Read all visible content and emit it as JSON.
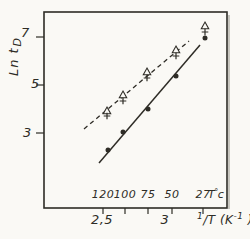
{
  "figure": {
    "bg": "#faf9f5",
    "ink": "#2e2c26",
    "shadow": "#bcbab2"
  },
  "axes": {
    "y_label_main": "Ln t",
    "y_label_sub": "D",
    "y_ticks": [
      {
        "label": "7",
        "value": 7,
        "y": 37,
        "lx": 21,
        "ly": 26
      },
      {
        "label": "5",
        "value": 5,
        "y": 85,
        "lx": 31,
        "ly": 77
      },
      {
        "label": "3",
        "value": 3,
        "y": 133,
        "lx": 23,
        "ly": 126
      }
    ],
    "x_top_ticks": [
      {
        "label": "120",
        "value": 120,
        "x": 103
      },
      {
        "label": "100",
        "value": 100,
        "x": 125
      },
      {
        "label": "75",
        "value": 75,
        "x": 148
      },
      {
        "label": "50",
        "value": 50,
        "x": 172
      },
      {
        "label": "27",
        "value": 27,
        "x": 203
      }
    ],
    "x_top_unit": {
      "T": "T",
      "ring": "°",
      "c": "c"
    },
    "x_bottom_labels": [
      {
        "label": "2,5",
        "value": 2.5,
        "x": 102
      },
      {
        "label": "3",
        "value": 3,
        "x": 165
      }
    ],
    "x_unit": {
      "num": "1",
      "mid": "/T (K",
      "sup": "-1",
      "end": " )"
    }
  },
  "chart_data": {
    "type": "scatter",
    "title": "",
    "ylabel": "Ln t_D",
    "xlabel": "1/T (K-1)",
    "xlabel_secondary": "T (°C)",
    "grid": false,
    "legend": "none",
    "y_ticks": [
      3,
      5,
      7
    ],
    "x_invT_tick_labels": [
      2.5,
      3
    ],
    "categories_temperature_C": [
      120,
      100,
      75,
      50,
      27
    ],
    "categories_invT_approx": [
      2.54,
      2.68,
      2.87,
      3.1,
      3.33
    ],
    "series": [
      {
        "name": "open-triangle",
        "marker": "triangle-open",
        "line_style": "dashed",
        "values_ln_t": [
          3.9,
          4.6,
          5.5,
          6.5,
          7.5
        ]
      },
      {
        "name": "plus",
        "marker": "plus",
        "line_style": "dashed",
        "values_ln_t": [
          3.7,
          4.3,
          5.3,
          6.2,
          7.2
        ]
      },
      {
        "name": "filled-circle",
        "marker": "circle-filled",
        "line_style": "solid",
        "values_ln_t": [
          2.3,
          3.0,
          4.0,
          5.4,
          7.0
        ]
      }
    ]
  },
  "render": {
    "box": {
      "x1": 44,
      "y1": 12,
      "x2": 227,
      "y2": 208
    },
    "tick_len_y": 8,
    "tick_len_x": 6,
    "lines": {
      "solid": {
        "x1": 99,
        "y1": 163,
        "x2": 200,
        "y2": 45
      },
      "dashed": {
        "x1": 84,
        "y1": 129,
        "x2": 189,
        "y2": 41
      }
    },
    "markers": {
      "circles": [
        [
          108,
          150
        ],
        [
          123,
          132
        ],
        [
          148,
          109
        ],
        [
          176,
          76
        ],
        [
          205,
          38
        ]
      ],
      "triangles": [
        [
          107,
          111
        ],
        [
          123,
          95
        ],
        [
          147,
          72
        ],
        [
          176,
          50
        ],
        [
          205,
          26
        ]
      ],
      "pluses": [
        [
          107,
          116
        ],
        [
          123,
          101
        ],
        [
          147,
          78
        ],
        [
          176,
          56
        ],
        [
          205,
          32
        ]
      ]
    }
  }
}
